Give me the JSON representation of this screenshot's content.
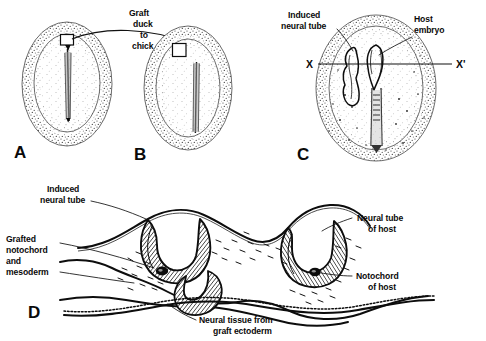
{
  "figure": {
    "caption_absent": true,
    "panels": [
      {
        "id": "A",
        "letter": "A",
        "name": "donor-duck-embryo",
        "description": "Duck donor embryo with primitive streak and graft region outlined by a small square"
      },
      {
        "id": "B",
        "letter": "B",
        "name": "host-chick-embryo",
        "description": "Chick host embryo with grafted square placed lateral to its own primitive streak"
      },
      {
        "id": "C",
        "letter": "C",
        "name": "host-embryo-with-induced-tube",
        "description": "Host embryo in dorsal view showing induced neural tube beside host embryo axis, with section plane X to X prime"
      },
      {
        "id": "D",
        "letter": "D",
        "name": "transverse-section",
        "description": "Transverse section through level X to X prime showing induced neural tube, grafted notochord and mesoderm, host neural tube, host notochord and neural tissue from graft ectoderm"
      }
    ],
    "labels": {
      "graft_transfer": [
        "Graft",
        "duck",
        "to",
        "chick"
      ],
      "induced_neural_tube_c": [
        "Induced",
        "neural tube"
      ],
      "host_embryo": [
        "Host",
        "embryo"
      ],
      "section_left": "X",
      "section_right": "X'",
      "induced_neural_tube_d": [
        "Induced",
        "neural tube"
      ],
      "grafted_notochord": [
        "Grafted",
        "notochord",
        "and",
        "mesoderm"
      ],
      "neural_tube_of_host": [
        "Neural tube",
        "of host"
      ],
      "notochord_of_host": [
        "Notochord",
        "of host"
      ],
      "neural_tissue_graft": [
        "Neural tissue from",
        "graft ectoderm"
      ]
    },
    "colors": {
      "background": "#ffffff",
      "ink": "#0b0b0b",
      "stipple": "#4a4a4a",
      "outline": "#3c3c3c"
    }
  }
}
